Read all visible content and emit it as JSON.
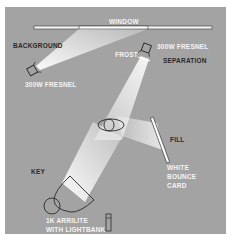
{
  "diagram": {
    "type": "lighting-plot",
    "colors": {
      "background": "#a3a3a3",
      "frame_border": "#ffffff",
      "beam": "#f0f0f0",
      "outline": "#2a2a2a"
    },
    "labels": {
      "window": "WINDOW",
      "background": "BACKGROUND",
      "background_light": "300W FRESNEL",
      "frost": "FROST",
      "separation_light": "300W FRESNEL",
      "separation": "SEPARATION",
      "fill": "FILL",
      "bounce_card_1": "WHITE",
      "bounce_card_2": "BOUNCE",
      "bounce_card_3": "CARD",
      "key": "KEY",
      "key_light_1": "1K ARRILITE",
      "key_light_2": "WITH LIGHTBANK"
    }
  }
}
